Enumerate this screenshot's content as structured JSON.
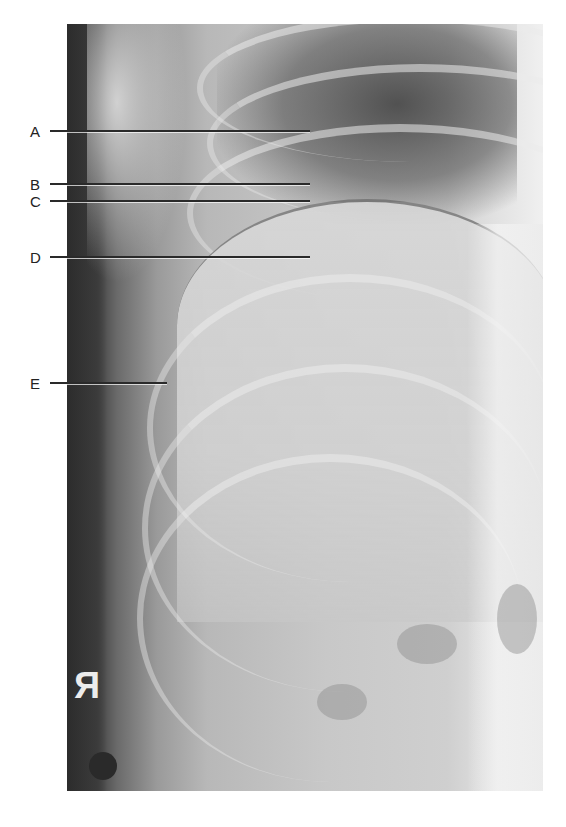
{
  "figure": {
    "type": "radiograph",
    "orientation_marker": "R",
    "orientation_marker_mirrored": true,
    "labels": [
      {
        "id": "A",
        "text": "A",
        "y": 131,
        "line_end_x": 310
      },
      {
        "id": "B",
        "text": "B",
        "y": 184,
        "line_end_x": 310
      },
      {
        "id": "C",
        "text": "C",
        "y": 201,
        "line_end_x": 310
      },
      {
        "id": "D",
        "text": "D",
        "y": 257,
        "line_end_x": 310
      },
      {
        "id": "E",
        "text": "E",
        "y": 383,
        "line_end_x": 167
      }
    ]
  }
}
